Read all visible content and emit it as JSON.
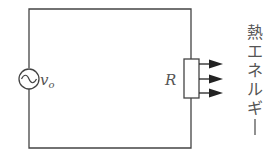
{
  "diagram": {
    "type": "circuit",
    "source": {
      "label": "v",
      "subscript": "o",
      "symbol": "ac-source"
    },
    "resistor": {
      "label": "R"
    },
    "output": {
      "label_chars": [
        "熱",
        "エ",
        "ネ",
        "ル",
        "ギ",
        "ー"
      ],
      "label": "熱エネルギー",
      "arrow_count": 3
    },
    "colors": {
      "line": "#444444",
      "text": "#555555",
      "background": "#ffffff"
    }
  }
}
